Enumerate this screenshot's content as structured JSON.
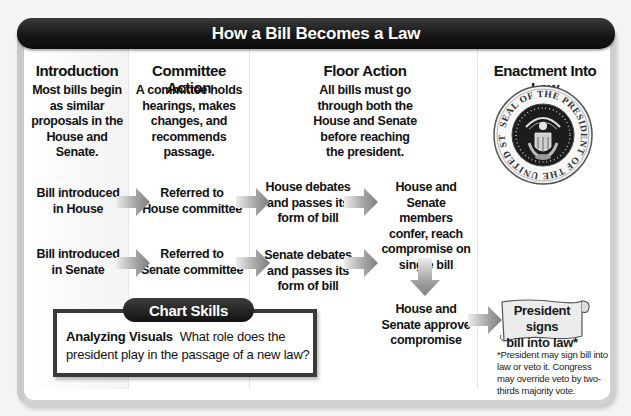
{
  "header": {
    "title": "How a Bill Becomes a Law"
  },
  "columns": [
    {
      "heading": "Introduction",
      "description": [
        "Most bills begin",
        "as similar",
        "proposals in the",
        "House and",
        "Senate."
      ]
    },
    {
      "heading": "Committee Action",
      "description": [
        "A committee holds",
        "hearings, makes",
        "changes, and",
        "recommends",
        "passage."
      ]
    },
    {
      "heading": "Floor Action",
      "description": [
        "All bills must go",
        "through both the",
        "House and Senate",
        "before reaching",
        "the president."
      ]
    },
    {
      "heading": "Enactment Into Law",
      "description": []
    }
  ],
  "steps": {
    "house_intro": [
      "Bill introduced",
      "in House"
    ],
    "senate_intro": [
      "Bill introduced",
      "in Senate"
    ],
    "house_committee": [
      "Referred to",
      "House committee"
    ],
    "senate_committee": [
      "Referred to",
      "Senate committee"
    ],
    "house_debate": [
      "House debates",
      "and passes its",
      "form of bill"
    ],
    "senate_debate": [
      "Senate debates",
      "and passes its",
      "form of bill"
    ],
    "conference": [
      "House and",
      "Senate members",
      "confer, reach",
      "compromise on",
      "single bill"
    ],
    "approve": [
      "House and",
      "Senate approve",
      "compromise"
    ],
    "sign": [
      "President signs",
      "bill into law*"
    ]
  },
  "footnote": "*President may sign bill into law or veto it. Congress may override veto by two-thirds majority vote.",
  "seal": {
    "icon": "presidential-seal-icon",
    "ring_text": "SEAL OF THE PRESIDENT OF THE UNITED STATES"
  },
  "chart_skills": {
    "tab_label": "Chart Skills",
    "lead": "Analyzing Visuals",
    "question": "What role does the president play in the passage of a new law?"
  },
  "colors": {
    "header_bg": "#151515",
    "arrow_dark": "#8a8a8a",
    "arrow_light": "#e2e2e2",
    "panel_border": "#c9c9c9",
    "scroll_fill": "#eaeaea"
  }
}
